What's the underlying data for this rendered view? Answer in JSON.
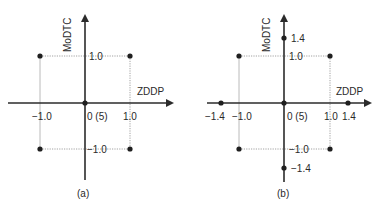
{
  "panels": [
    {
      "id": "a",
      "caption": "(a)",
      "x_axis_label": "ZDDP",
      "y_axis_label": "MoDTC",
      "center_label": "0 (5)",
      "x_tick_labels": [
        "−1.0",
        "1.0"
      ],
      "y_tick_labels": [
        "1.0",
        "−1.0"
      ],
      "points": [
        {
          "x": -1.0,
          "y": 1.0
        },
        {
          "x": 1.0,
          "y": 1.0
        },
        {
          "x": -1.0,
          "y": -1.0
        },
        {
          "x": 1.0,
          "y": -1.0
        },
        {
          "x": 0,
          "y": 0
        }
      ]
    },
    {
      "id": "b",
      "caption": "(b)",
      "x_axis_label": "ZDDP",
      "y_axis_label": "MoDTC",
      "center_label": "0 (5)",
      "x_tick_labels": [
        "−1.4",
        "−1.0",
        "1.0",
        "1.4"
      ],
      "y_tick_labels": [
        "1.4",
        "1.0",
        "−1.0",
        "−1.4"
      ],
      "points": [
        {
          "x": -1.0,
          "y": 1.0
        },
        {
          "x": 1.0,
          "y": 1.0
        },
        {
          "x": -1.0,
          "y": -1.0
        },
        {
          "x": 1.0,
          "y": -1.0
        },
        {
          "x": -1.4,
          "y": 0
        },
        {
          "x": 1.4,
          "y": 0
        },
        {
          "x": 0,
          "y": 1.4
        },
        {
          "x": 0,
          "y": -1.4
        },
        {
          "x": 0,
          "y": 0
        }
      ]
    }
  ],
  "colors": {
    "axis": "#2b2b2b",
    "guide": "#8a8a8a",
    "point": "#1f1f1f"
  }
}
